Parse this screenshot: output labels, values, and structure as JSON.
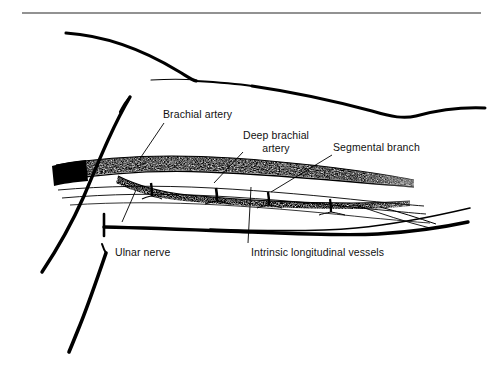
{
  "figure": {
    "background_color": "#ffffff",
    "ink_color": "#000000",
    "rule_color": "#6e6e6e",
    "width": 496,
    "height": 372
  },
  "labels": {
    "brachial_artery": "Brachial artery",
    "deep_brachial_artery": "Deep brachial artery",
    "segmental_branch": "Segmental branch",
    "ulnar_nerve": "Ulnar nerve",
    "intrinsic_longitudinal_vessels": "Intrinsic longitudinal vessels"
  },
  "structures": {
    "brachial_artery_note": "stippled band, upper",
    "deep_brachial_artery_note": "stippled band, lower branch",
    "segmental_branch_note": "short connecting branches descending from artery",
    "ulnar_nerve_note": "thick solid black longitudinal line",
    "intrinsic_longitudinal_vessels_note": "thin paired longitudinal lines below artery"
  }
}
